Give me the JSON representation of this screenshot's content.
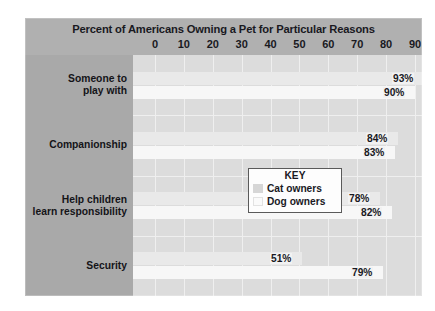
{
  "chart_data": {
    "type": "bar",
    "orientation": "horizontal",
    "title": "Percent of Americans Owning a Pet for Particular Reasons",
    "xlabel": "",
    "ylabel": "",
    "xlim": [
      0,
      90
    ],
    "xticks": [
      0,
      10,
      20,
      30,
      40,
      50,
      60,
      70,
      80,
      90
    ],
    "xtick_labels": [
      "0",
      "10",
      "20",
      "30",
      "40",
      "50",
      "60",
      "70",
      "80",
      "90"
    ],
    "grid": true,
    "grid_axis": "x",
    "legend_title": "KEY",
    "legend_position": "inside-lower-right",
    "categories": [
      "Someone to play with",
      "Companionship",
      "Help children learn responsibility",
      "Security"
    ],
    "series": [
      {
        "name": "Cat owners",
        "values": [
          93,
          84,
          78,
          51
        ],
        "color": "#e9e9e9"
      },
      {
        "name": "Dog owners",
        "values": [
          90,
          83,
          82,
          79
        ],
        "color": "#f7f7f7"
      }
    ],
    "value_labels": [
      [
        "93%",
        "90%"
      ],
      [
        "84%",
        "83%"
      ],
      [
        "78%",
        "82%"
      ],
      [
        "51%",
        "79%"
      ]
    ],
    "colors": {
      "figure_background": "#b0b0b0",
      "category_panel": "#a9a9a9",
      "plot_background": "#dcdcdc",
      "gridline": "#efefef",
      "text": "#19191f",
      "legend_background": "#fdfdfd",
      "legend_border": "#5a5a5a"
    }
  },
  "axis": {
    "ticks": [
      {
        "label": "0",
        "value": 0
      },
      {
        "label": "10",
        "value": 10
      },
      {
        "label": "20",
        "value": 20
      },
      {
        "label": "30",
        "value": 30
      },
      {
        "label": "40",
        "value": 40
      },
      {
        "label": "50",
        "value": 50
      },
      {
        "label": "60",
        "value": 60
      },
      {
        "label": "70",
        "value": 70
      },
      {
        "label": "80",
        "value": 80
      },
      {
        "label": "90",
        "value": 90
      }
    ]
  },
  "categories": [
    {
      "line1": "Someone to",
      "line2": "play with"
    },
    {
      "line1": "Companionship",
      "line2": ""
    },
    {
      "line1": "Help children",
      "line2": "learn responsibility"
    },
    {
      "line1": "Security",
      "line2": ""
    }
  ],
  "legend": {
    "title": "KEY",
    "entries": [
      {
        "label": "Cat owners"
      },
      {
        "label": "Dog owners"
      }
    ]
  }
}
